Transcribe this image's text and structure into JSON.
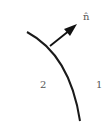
{
  "diagram": {
    "normal_label": "n̂",
    "regions": [
      {
        "label": "2",
        "side": "left"
      },
      {
        "label": "1",
        "side": "right"
      }
    ],
    "colors": {
      "curve": "#1a1a1a",
      "arrow": "#111111",
      "text": "#555555",
      "background": "#ffffff"
    }
  }
}
